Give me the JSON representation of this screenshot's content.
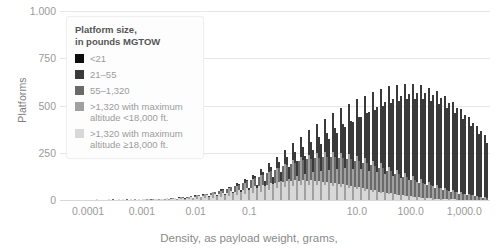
{
  "chart_data": {
    "type": "bar",
    "subtype": "stacked-histogram",
    "title": "",
    "xlabel": "Density, as payload weight, grams,",
    "ylabel": "Platforms",
    "xscale": "log",
    "xlim": [
      3e-05,
      3000
    ],
    "ylim": [
      0,
      1000
    ],
    "grid": true,
    "xticks": [
      0.0001,
      0.001,
      0.01,
      0.1,
      10.0,
      100.0,
      1000.0
    ],
    "xticklabels": [
      "0.0001",
      "0.001",
      "0.01",
      "0.1",
      "10.0",
      "100.0",
      "1,000.0"
    ],
    "yticks": [
      0,
      250,
      500,
      750,
      1000
    ],
    "yticklabels": [
      "0",
      "250",
      "500",
      "750",
      "1.000"
    ],
    "legend_title_line1": "Platform size,",
    "legend_title_line2": "in pounds MGTOW",
    "legend_position": "upper-left-inside",
    "series": [
      {
        "name": "<21",
        "color": "#0d0d0d"
      },
      {
        "name": "21–55",
        "color": "#3a3a3a"
      },
      {
        "name": "55–1,320",
        "color": "#6a6a6a"
      },
      {
        "name": ">1,320 with maximum",
        "name_line2": "altitude <18,000 ft.",
        "color": "#a0a0a0"
      },
      {
        "name": ">1,320 with maximum",
        "name_line2": "altitude ≥18,000 ft.",
        "color": "#d8d8d8"
      }
    ],
    "bin_pixel_width": 2,
    "bin_count": 215,
    "stack_values": [
      [
        0,
        0,
        0,
        0,
        0
      ],
      [
        0,
        0,
        0,
        0,
        0
      ],
      [
        0,
        0,
        0,
        0,
        0
      ],
      [
        0,
        0,
        0,
        0,
        0
      ],
      [
        0,
        0,
        0,
        0,
        0
      ],
      [
        0,
        0,
        0,
        0,
        0
      ],
      [
        0,
        0,
        0,
        0,
        0
      ],
      [
        0,
        0,
        0,
        0,
        0
      ],
      [
        0,
        0,
        0,
        0,
        0
      ],
      [
        0,
        0,
        0,
        0,
        0
      ],
      [
        0,
        0,
        0,
        0,
        0
      ],
      [
        0,
        0,
        0,
        0,
        0
      ],
      [
        0,
        0,
        0,
        0,
        0
      ],
      [
        0,
        0,
        0,
        0,
        0
      ],
      [
        0,
        0,
        0,
        0,
        2
      ],
      [
        0,
        0,
        0,
        0,
        0
      ],
      [
        0,
        0,
        0,
        1,
        0
      ],
      [
        0,
        0,
        0,
        0,
        0
      ],
      [
        0,
        0,
        0,
        0,
        3
      ],
      [
        0,
        0,
        0,
        0,
        0
      ],
      [
        0,
        0,
        0,
        2,
        0
      ],
      [
        0,
        0,
        0,
        0,
        0
      ],
      [
        0,
        0,
        0,
        0,
        2
      ],
      [
        0,
        0,
        0,
        1,
        0
      ],
      [
        0,
        0,
        0,
        0,
        4
      ],
      [
        0,
        0,
        0,
        0,
        0
      ],
      [
        0,
        0,
        1,
        0,
        2
      ],
      [
        0,
        0,
        0,
        0,
        0
      ],
      [
        0,
        0,
        0,
        2,
        0
      ],
      [
        0,
        0,
        0,
        0,
        3
      ],
      [
        0,
        0,
        0,
        0,
        0
      ],
      [
        0,
        0,
        0,
        1,
        4
      ],
      [
        0,
        0,
        0,
        0,
        0
      ],
      [
        0,
        0,
        1,
        0,
        2
      ],
      [
        0,
        0,
        0,
        2,
        0
      ],
      [
        0,
        0,
        0,
        0,
        5
      ],
      [
        0,
        0,
        0,
        0,
        0
      ],
      [
        0,
        0,
        0,
        3,
        2
      ],
      [
        0,
        0,
        1,
        0,
        0
      ],
      [
        0,
        0,
        0,
        0,
        6
      ],
      [
        0,
        0,
        0,
        2,
        0
      ],
      [
        0,
        0,
        0,
        0,
        4
      ],
      [
        0,
        0,
        1,
        0,
        3
      ],
      [
        0,
        0,
        0,
        3,
        0
      ],
      [
        0,
        0,
        0,
        0,
        7
      ],
      [
        0,
        0,
        2,
        0,
        2
      ],
      [
        0,
        0,
        0,
        4,
        0
      ],
      [
        0,
        0,
        0,
        0,
        6
      ],
      [
        0,
        0,
        1,
        0,
        4
      ],
      [
        0,
        0,
        0,
        5,
        0
      ],
      [
        0,
        0,
        0,
        0,
        8
      ],
      [
        0,
        0,
        2,
        0,
        5
      ],
      [
        0,
        0,
        0,
        6,
        2
      ],
      [
        0,
        0,
        1,
        0,
        9
      ],
      [
        0,
        0,
        0,
        4,
        0
      ],
      [
        0,
        0,
        3,
        0,
        7
      ],
      [
        0,
        0,
        0,
        8,
        3
      ],
      [
        0,
        0,
        2,
        0,
        11
      ],
      [
        0,
        0,
        0,
        6,
        0
      ],
      [
        0,
        1,
        4,
        0,
        9
      ],
      [
        0,
        0,
        0,
        10,
        4
      ],
      [
        0,
        0,
        3,
        0,
        13
      ],
      [
        0,
        1,
        0,
        8,
        0
      ],
      [
        0,
        0,
        5,
        0,
        12
      ],
      [
        0,
        0,
        0,
        13,
        5
      ],
      [
        0,
        1,
        4,
        0,
        16
      ],
      [
        0,
        0,
        0,
        11,
        0
      ],
      [
        0,
        2,
        7,
        0,
        15
      ],
      [
        0,
        0,
        0,
        17,
        7
      ],
      [
        0,
        1,
        6,
        0,
        20
      ],
      [
        0,
        0,
        0,
        14,
        0
      ],
      [
        0,
        3,
        10,
        0,
        19
      ],
      [
        0,
        1,
        0,
        22,
        9
      ],
      [
        0,
        0,
        9,
        0,
        25
      ],
      [
        0,
        2,
        0,
        18,
        0
      ],
      [
        0,
        0,
        13,
        0,
        24
      ],
      [
        0,
        4,
        0,
        28,
        12
      ],
      [
        0,
        1,
        12,
        0,
        31
      ],
      [
        0,
        3,
        0,
        23,
        0
      ],
      [
        0,
        0,
        17,
        0,
        30
      ],
      [
        0,
        6,
        0,
        35,
        15
      ],
      [
        0,
        2,
        16,
        0,
        38
      ],
      [
        0,
        4,
        0,
        29,
        0
      ],
      [
        0,
        0,
        22,
        0,
        37
      ],
      [
        0,
        9,
        0,
        43,
        19
      ],
      [
        0,
        3,
        21,
        0,
        46
      ],
      [
        0,
        6,
        0,
        36,
        0
      ],
      [
        0,
        0,
        28,
        0,
        45
      ],
      [
        0,
        13,
        0,
        52,
        24
      ],
      [
        0,
        5,
        27,
        0,
        55
      ],
      [
        0,
        9,
        0,
        44,
        0
      ],
      [
        0,
        0,
        35,
        0,
        54
      ],
      [
        0,
        18,
        0,
        62,
        30
      ],
      [
        0,
        8,
        34,
        0,
        64
      ],
      [
        0,
        13,
        0,
        53,
        0
      ],
      [
        0,
        0,
        43,
        0,
        63
      ],
      [
        0,
        25,
        0,
        73,
        37
      ],
      [
        0,
        12,
        42,
        0,
        73
      ],
      [
        0,
        19,
        0,
        63,
        0
      ],
      [
        0,
        0,
        52,
        0,
        72
      ],
      [
        0,
        34,
        0,
        85,
        45
      ],
      [
        0,
        17,
        51,
        0,
        82
      ],
      [
        0,
        27,
        0,
        74,
        0
      ],
      [
        0,
        0,
        62,
        0,
        81
      ],
      [
        0,
        45,
        0,
        97,
        53
      ],
      [
        0,
        24,
        61,
        0,
        90
      ],
      [
        0,
        37,
        0,
        86,
        0
      ],
      [
        0,
        0,
        73,
        0,
        88
      ],
      [
        0,
        58,
        0,
        110,
        61
      ],
      [
        0,
        33,
        72,
        0,
        96
      ],
      [
        0,
        49,
        0,
        99,
        0
      ],
      [
        0,
        0,
        84,
        0,
        94
      ],
      [
        0,
        73,
        0,
        123,
        68
      ],
      [
        0,
        44,
        83,
        0,
        101
      ],
      [
        0,
        63,
        0,
        112,
        0
      ],
      [
        0,
        0,
        95,
        0,
        98
      ],
      [
        0,
        90,
        0,
        136,
        74
      ],
      [
        0,
        57,
        94,
        0,
        104
      ],
      [
        0,
        79,
        0,
        125,
        0
      ],
      [
        0,
        0,
        106,
        0,
        100
      ],
      [
        0,
        109,
        0,
        148,
        78
      ],
      [
        0,
        72,
        105,
        0,
        105
      ],
      [
        0,
        97,
        0,
        137,
        0
      ],
      [
        0,
        0,
        116,
        0,
        100
      ],
      [
        0,
        130,
        0,
        159,
        80
      ],
      [
        0,
        89,
        115,
        0,
        104
      ],
      [
        0,
        117,
        0,
        147,
        0
      ],
      [
        0,
        0,
        125,
        0,
        98
      ],
      [
        0,
        153,
        0,
        168,
        80
      ],
      [
        0,
        108,
        124,
        0,
        101
      ],
      [
        0,
        139,
        0,
        155,
        0
      ],
      [
        0,
        0,
        132,
        0,
        95
      ],
      [
        0,
        178,
        0,
        175,
        78
      ],
      [
        0,
        129,
        131,
        0,
        97
      ],
      [
        0,
        163,
        0,
        161,
        0
      ],
      [
        0,
        0,
        137,
        0,
        90
      ],
      [
        0,
        205,
        0,
        180,
        74
      ],
      [
        0,
        152,
        136,
        0,
        91
      ],
      [
        0,
        189,
        0,
        165,
        0
      ],
      [
        0,
        0,
        140,
        0,
        84
      ],
      [
        0,
        234,
        0,
        182,
        69
      ],
      [
        0,
        177,
        139,
        0,
        84
      ],
      [
        0,
        217,
        0,
        167,
        0
      ],
      [
        0,
        0,
        141,
        0,
        77
      ],
      [
        0,
        265,
        0,
        182,
        63
      ],
      [
        0,
        204,
        140,
        0,
        76
      ],
      [
        0,
        247,
        0,
        166,
        0
      ],
      [
        0,
        0,
        140,
        0,
        69
      ],
      [
        0,
        297,
        0,
        179,
        56
      ],
      [
        0,
        233,
        139,
        0,
        68
      ],
      [
        0,
        279,
        0,
        162,
        0
      ],
      [
        0,
        0,
        137,
        0,
        61
      ],
      [
        0,
        330,
        0,
        174,
        49
      ],
      [
        0,
        264,
        136,
        0,
        59
      ],
      [
        0,
        312,
        0,
        156,
        0
      ],
      [
        0,
        0,
        132,
        0,
        53
      ],
      [
        0,
        363,
        0,
        167,
        42
      ],
      [
        0,
        296,
        131,
        0,
        51
      ],
      [
        0,
        345,
        0,
        148,
        0
      ],
      [
        0,
        0,
        126,
        0,
        45
      ],
      [
        0,
        395,
        0,
        158,
        36
      ],
      [
        0,
        328,
        125,
        0,
        43
      ],
      [
        0,
        377,
        0,
        139,
        0
      ],
      [
        0,
        0,
        118,
        0,
        38
      ],
      [
        0,
        425,
        0,
        147,
        30
      ],
      [
        0,
        359,
        117,
        0,
        36
      ],
      [
        0,
        407,
        0,
        129,
        0
      ],
      [
        0,
        0,
        109,
        0,
        31
      ],
      [
        0,
        451,
        0,
        135,
        25
      ],
      [
        0,
        388,
        108,
        0,
        29
      ],
      [
        0,
        433,
        0,
        118,
        0
      ],
      [
        0,
        0,
        99,
        0,
        25
      ],
      [
        0,
        473,
        0,
        123,
        20
      ],
      [
        0,
        412,
        98,
        0,
        23
      ],
      [
        0,
        455,
        0,
        107,
        0
      ],
      [
        0,
        0,
        89,
        0,
        19
      ],
      [
        0,
        489,
        0,
        110,
        16
      ],
      [
        0,
        430,
        88,
        0,
        18
      ],
      [
        0,
        471,
        0,
        96,
        0
      ],
      [
        0,
        0,
        78,
        0,
        14
      ],
      [
        0,
        499,
        0,
        97,
        12
      ],
      [
        0,
        442,
        77,
        0,
        13
      ],
      [
        0,
        480,
        0,
        84,
        0
      ],
      [
        0,
        0,
        68,
        0,
        10
      ],
      [
        0,
        502,
        0,
        84,
        9
      ],
      [
        0,
        447,
        67,
        0,
        10
      ],
      [
        0,
        482,
        0,
        72,
        0
      ],
      [
        0,
        0,
        58,
        0,
        7
      ],
      [
        0,
        498,
        0,
        71,
        6
      ],
      [
        0,
        445,
        57,
        0,
        7
      ],
      [
        0,
        477,
        0,
        61,
        0
      ],
      [
        0,
        0,
        48,
        0,
        5
      ],
      [
        0,
        486,
        0,
        59,
        4
      ],
      [
        0,
        436,
        47,
        0,
        5
      ],
      [
        0,
        465,
        0,
        50,
        0
      ],
      [
        0,
        0,
        39,
        0,
        3
      ],
      [
        0,
        467,
        0,
        48,
        3
      ],
      [
        0,
        420,
        38,
        0,
        3
      ],
      [
        0,
        445,
        0,
        40,
        0
      ],
      [
        0,
        0,
        31,
        0,
        2
      ],
      [
        0,
        441,
        0,
        38,
        2
      ],
      [
        0,
        397,
        30,
        0,
        2
      ],
      [
        0,
        419,
        0,
        31,
        0
      ],
      [
        0,
        0,
        24,
        0,
        1
      ],
      [
        0,
        408,
        0,
        29,
        1
      ],
      [
        0,
        366,
        23,
        0,
        1
      ],
      [
        0,
        386,
        0,
        24,
        0
      ],
      [
        0,
        0,
        18,
        0,
        1
      ],
      [
        0,
        370,
        0,
        22,
        1
      ],
      [
        0,
        331,
        17,
        0,
        1
      ],
      [
        0,
        347,
        0,
        18,
        0
      ],
      [
        0,
        0,
        13,
        0,
        0
      ],
      [
        0,
        327,
        0,
        16,
        0
      ],
      [
        0,
        291,
        13,
        0,
        0
      ]
    ]
  }
}
